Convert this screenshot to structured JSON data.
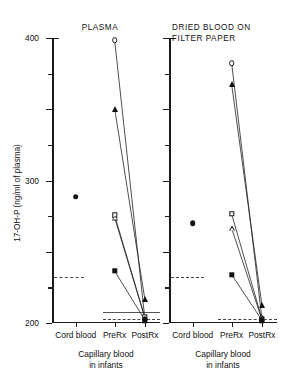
{
  "chart_data": {
    "type": "scatter",
    "title": "",
    "ylabel": "17-OH-P (ng/ml of plasma)",
    "xlabel": "",
    "ylim": [
      0,
      400
    ],
    "yticks": [
      0,
      100,
      200,
      300,
      400
    ],
    "yticklabels": [
      "0",
      "100",
      "200",
      "300",
      "400"
    ],
    "yminorticks": [
      50,
      150,
      250,
      350
    ],
    "grid": false,
    "legend": null,
    "categories": [
      "Cord blood",
      "PreRx",
      "PostRx"
    ],
    "panels": [
      {
        "title": "PLASMA",
        "caption": "Capillary blood\nin infants",
        "reference_lines": [
          {
            "value": 65,
            "style": "dashed",
            "x_start": 0.02,
            "x_end": 0.3
          },
          {
            "value": 15,
            "style": "solid",
            "x_start": 0.47,
            "x_end": 1.0
          },
          {
            "value": 5,
            "style": "dashed",
            "x_start": 0.47,
            "x_end": 1.0
          }
        ],
        "points": [
          {
            "name": "cord-blood-filled-circle",
            "marker": "circle-filled",
            "category": "Cord blood",
            "value": 177
          }
        ],
        "series": [
          {
            "name": "subject-1",
            "marker": "circle-open",
            "values": [
              397,
              6
            ]
          },
          {
            "name": "subject-2",
            "marker": "triangle-filled",
            "values": [
              301,
              33
            ]
          },
          {
            "name": "subject-3",
            "marker": "square-open",
            "values": [
              151,
              8
            ]
          },
          {
            "name": "subject-4",
            "marker": "triangle-open",
            "values": [
              148,
              7
            ]
          },
          {
            "name": "subject-5",
            "marker": "square-filled",
            "values": [
              73,
              4
            ]
          }
        ]
      },
      {
        "title": "DRIED BLOOD ON\nFILTER PAPER",
        "caption": "Capillary blood\nin infants",
        "reference_lines": [
          {
            "value": 65,
            "style": "dashed",
            "x_start": 0.02,
            "x_end": 0.32
          },
          {
            "value": 5,
            "style": "dashed",
            "x_start": 0.45,
            "x_end": 1.0
          }
        ],
        "points": [
          {
            "name": "cord-blood-filled-circle",
            "marker": "circle-filled",
            "category": "Cord blood",
            "value": 140
          }
        ],
        "series": [
          {
            "name": "subject-1",
            "marker": "circle-open",
            "values": [
              365,
              7
            ]
          },
          {
            "name": "subject-2",
            "marker": "triangle-filled",
            "values": [
              335,
              25
            ]
          },
          {
            "name": "subject-3",
            "marker": "square-open",
            "values": [
              153,
              6
            ]
          },
          {
            "name": "subject-4",
            "marker": "triangle-open",
            "values": [
              133,
              5
            ]
          },
          {
            "name": "subject-5",
            "marker": "square-filled",
            "values": [
              68,
              4
            ]
          }
        ]
      }
    ]
  }
}
